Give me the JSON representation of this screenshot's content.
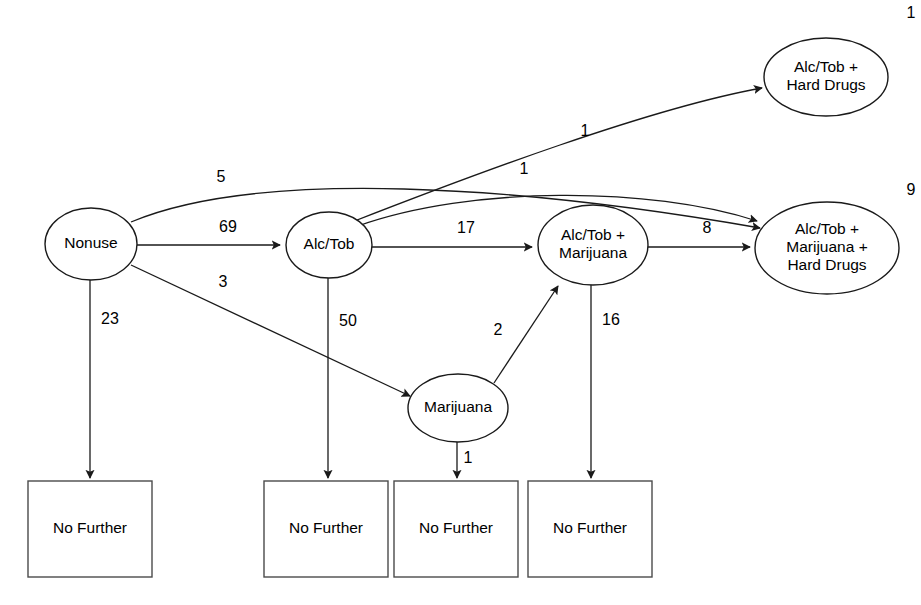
{
  "diagram": {
    "stroke_color": "#1a1a1a",
    "box_stroke_color": "#4a4a4a",
    "background": "#ffffff",
    "nodes": [
      {
        "id": "nonuse",
        "shape": "ellipse",
        "lines": [
          "Nonuse"
        ],
        "cx": 91,
        "cy": 244,
        "rx": 46,
        "ry": 36,
        "corner_label": ""
      },
      {
        "id": "alc_tob",
        "shape": "ellipse",
        "lines": [
          "Alc/Tob"
        ],
        "cx": 329,
        "cy": 245,
        "rx": 43,
        "ry": 33,
        "corner_label": ""
      },
      {
        "id": "alc_tob_hard_drugs",
        "shape": "ellipse",
        "lines": [
          "Alc/Tob +",
          "Hard Drugs"
        ],
        "cx": 826,
        "cy": 77,
        "rx": 62,
        "ry": 39,
        "corner_label": "1",
        "corner_x": 911,
        "corner_y": 14
      },
      {
        "id": "alc_tob_marijuana",
        "shape": "ellipse",
        "lines": [
          "Alc/Tob +",
          "Marijuana"
        ],
        "cx": 593,
        "cy": 245,
        "rx": 55,
        "ry": 40,
        "corner_label": ""
      },
      {
        "id": "alc_tob_marijuana_hard_drugs",
        "shape": "ellipse",
        "lines": [
          "Alc/Tob +",
          "Marijuana +",
          "Hard Drugs"
        ],
        "cx": 827,
        "cy": 248,
        "rx": 72,
        "ry": 46,
        "corner_label": "9",
        "corner_x": 911,
        "corner_y": 191
      },
      {
        "id": "marijuana",
        "shape": "ellipse",
        "lines": [
          "Marijuana"
        ],
        "cx": 458,
        "cy": 408,
        "rx": 50,
        "ry": 34,
        "corner_label": ""
      }
    ],
    "terminal_boxes": [
      {
        "id": "no_further_1",
        "label": "No Further",
        "x": 28,
        "y": 481,
        "w": 124,
        "h": 96
      },
      {
        "id": "no_further_2",
        "label": "No Further",
        "x": 264,
        "y": 481,
        "w": 124,
        "h": 96
      },
      {
        "id": "no_further_3",
        "label": "No Further",
        "x": 394,
        "y": 481,
        "w": 124,
        "h": 96
      },
      {
        "id": "no_further_4",
        "label": "No Further",
        "x": 528,
        "y": 481,
        "w": 124,
        "h": 96
      }
    ],
    "edges": [
      {
        "id": "nonuse-to-alc_tob",
        "from": "Nonuse",
        "to": "Alc/Tob",
        "label": "69",
        "label_x": 228,
        "label_y": 228,
        "path": "M 137 245 L 280 245"
      },
      {
        "id": "nonuse-to-alc_tob_marijuana_hard_drugs",
        "from": "Nonuse",
        "to": "Alc/Tob + Marijuana + Hard Drugs",
        "label": "5",
        "label_x": 221,
        "label_y": 178,
        "path": "M 131 222 C 260 168, 520 186, 760 228"
      },
      {
        "id": "nonuse-to-marijuana",
        "from": "Nonuse",
        "to": "Marijuana",
        "label": "3",
        "label_x": 223,
        "label_y": 283,
        "path": "M 131 265 L 410 396"
      },
      {
        "id": "nonuse-to-no_further_1",
        "from": "Nonuse",
        "to": "No Further",
        "label": "23",
        "label_x": 110,
        "label_y": 320,
        "path": "M 90 280 L 90 478"
      },
      {
        "id": "alc_tob-to-alc_tob_marijuana",
        "from": "Alc/Tob",
        "to": "Alc/Tob + Marijuana",
        "label": "17",
        "label_x": 466,
        "label_y": 229,
        "path": "M 372 247 L 532 247"
      },
      {
        "id": "alc_tob-to-alc_tob_hard_drugs",
        "from": "Alc/Tob",
        "to": "Alc/Tob + Hard Drugs",
        "label": "1",
        "label_x": 585,
        "label_y": 132,
        "path": "M 352 222 C 470 176, 650 108, 762 88"
      },
      {
        "id": "alc_tob-to-alc_tob_marijuana_hard_drugs",
        "from": "Alc/Tob",
        "to": "Alc/Tob + Marijuana + Hard Drugs",
        "label": "1",
        "label_x": 524,
        "label_y": 170,
        "path": "M 358 226 C 470 186, 650 186, 757 221"
      },
      {
        "id": "alc_tob-to-no_further_2",
        "from": "Alc/Tob",
        "to": "No Further",
        "label": "50",
        "label_x": 348,
        "label_y": 322,
        "path": "M 328 278 L 328 478"
      },
      {
        "id": "marijuana-to-alc_tob_marijuana",
        "from": "Marijuana",
        "to": "Alc/Tob + Marijuana",
        "label": "2",
        "label_x": 498,
        "label_y": 331,
        "path": "M 494 383 L 558 286"
      },
      {
        "id": "marijuana-to-no_further_3",
        "from": "Marijuana",
        "to": "No Further",
        "label": "1",
        "label_x": 468,
        "label_y": 459,
        "path": "M 457 442 L 457 478"
      },
      {
        "id": "alc_tob_marijuana-to-alc_tob_marijuana_hard_drugs",
        "from": "Alc/Tob + Marijuana",
        "to": "Alc/Tob + Marijuana + Hard Drugs",
        "label": "8",
        "label_x": 707,
        "label_y": 229,
        "path": "M 648 247 L 750 247"
      },
      {
        "id": "alc_tob_marijuana-to-no_further_4",
        "from": "Alc/Tob + Marijuana",
        "to": "No Further",
        "label": "16",
        "label_x": 611,
        "label_y": 321,
        "path": "M 591 285 L 591 478"
      }
    ]
  }
}
